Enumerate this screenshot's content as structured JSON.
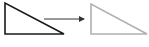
{
  "diagram": {
    "source_shape": {
      "type": "right-triangle",
      "points": "5,3 5,34 64,34",
      "stroke": "#1a1a1a",
      "stroke_width": 1.6
    },
    "arrow": {
      "x1": 44,
      "y1": 19,
      "x2": 84,
      "y2": 19,
      "stroke": "#333333"
    },
    "target_shape": {
      "type": "right-triangle",
      "points": "91,4 91,34 147,34",
      "stroke": "#b0b0b0",
      "stroke_width": 1.6
    }
  }
}
